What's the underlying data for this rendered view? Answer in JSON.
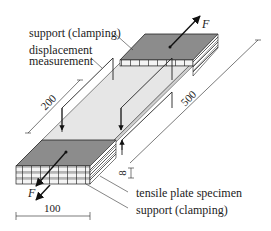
{
  "labels": {
    "support_top": "support (clamping)",
    "displacement_line1": "displacement",
    "displacement_line2": "measurement",
    "specimen": "tensile plate specimen",
    "support_bottom": "support (clamping)"
  },
  "forces": {
    "top": "F",
    "bottom": "F"
  },
  "dimensions": {
    "gauge_length": "200",
    "total_length": "500",
    "width": "100",
    "thickness": "8"
  },
  "colors": {
    "clamp_top": "#8c8c8c",
    "specimen": "#e6e6e6",
    "line": "#222222",
    "background": "#ffffff"
  }
}
